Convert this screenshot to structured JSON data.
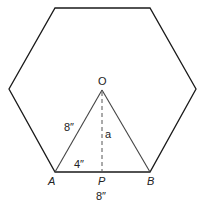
{
  "diagram": {
    "type": "regular-hexagon-with-central-triangle",
    "colors": {
      "stroke": "#1a1a1a",
      "triangle_stroke": "#444444",
      "background": "#ffffff"
    },
    "hexagon": {
      "vertices": [
        [
          55,
          8
        ],
        [
          150,
          8
        ],
        [
          196,
          89
        ],
        [
          150,
          172
        ],
        [
          55,
          172
        ],
        [
          9,
          89
        ]
      ]
    },
    "triangle": {
      "vertices": {
        "O": [
          102,
          90
        ],
        "A": [
          55,
          172
        ],
        "B": [
          150,
          172
        ]
      }
    },
    "apothem": {
      "from": [
        102,
        90
      ],
      "to": [
        102,
        172
      ],
      "style": "dashed"
    },
    "labels": {
      "O": "O",
      "A": "A",
      "P": "P",
      "B": "B",
      "side_OA": "8″",
      "half_base_AP": "4″",
      "apothem": "a",
      "base_AB": "8″"
    }
  }
}
